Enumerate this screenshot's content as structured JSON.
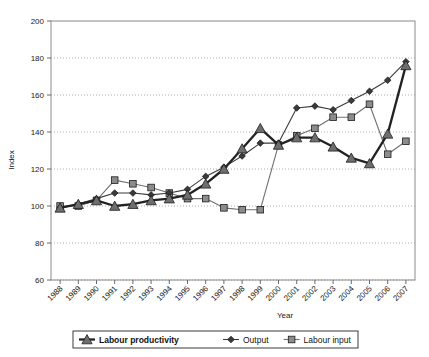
{
  "chart_data": {
    "type": "line",
    "title": "",
    "xlabel": "Year",
    "ylabel": "Index",
    "ylim": [
      60,
      200
    ],
    "yticks": [
      60,
      80,
      100,
      120,
      140,
      160,
      180,
      200
    ],
    "grid": "horizontal-dotted",
    "legend_position": "bottom",
    "categories": [
      "1988",
      "1989",
      "1990",
      "1991",
      "1992",
      "1993",
      "1994",
      "1995",
      "1996",
      "1997",
      "1998",
      "1999",
      "2000",
      "2001",
      "2002",
      "2003",
      "2004",
      "2005",
      "2006",
      "2007"
    ],
    "series": [
      {
        "name": "Labour productivity",
        "marker": "triangle",
        "emphasis": "bold",
        "color": "#3a3a3a",
        "values": [
          99,
          101,
          103,
          100,
          101,
          103,
          104,
          106,
          112,
          120,
          131,
          142,
          133,
          137,
          137,
          132,
          126,
          123,
          139,
          176
        ]
      },
      {
        "name": "Output",
        "marker": "diamond",
        "emphasis": "normal",
        "color": "#3a3a3a",
        "values": [
          99,
          101,
          104,
          107,
          107,
          106,
          107,
          109,
          116,
          121,
          127,
          134,
          134,
          153,
          154,
          152,
          157,
          162,
          168,
          178
        ]
      },
      {
        "name": "Labour input",
        "marker": "square",
        "emphasis": "normal",
        "color": "#808080",
        "values": [
          100,
          100,
          103,
          114,
          112,
          110,
          107,
          104,
          104,
          99,
          98,
          98,
          133,
          138,
          142,
          148,
          148,
          155,
          128,
          135
        ]
      }
    ]
  },
  "legend": {
    "items": [
      {
        "label": "Labour productivity"
      },
      {
        "label": "Output"
      },
      {
        "label": "Labour input"
      }
    ]
  }
}
